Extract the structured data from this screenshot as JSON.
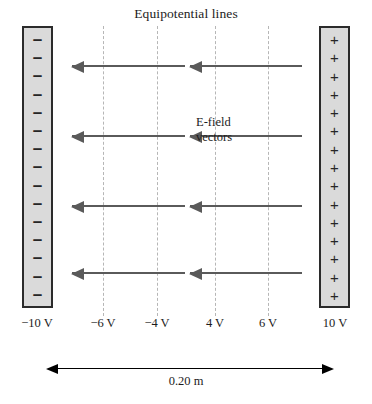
{
  "diagram": {
    "title": "Equipotential lines",
    "efield_label": {
      "line1": "E-field",
      "line2": "vectors"
    },
    "dimension": {
      "value": "0.20 m"
    },
    "plates": {
      "left": {
        "polarity_symbol": "–",
        "count": 15,
        "voltage_label": "−10 V"
      },
      "right": {
        "polarity_symbol": "+",
        "count": 15,
        "voltage_label": "10 V"
      }
    },
    "equipotentials": [
      {
        "label": "−6 V",
        "x": 103
      },
      {
        "label": "−4 V",
        "x": 157
      },
      {
        "label": "4 V",
        "x": 215
      },
      {
        "label": "6 V",
        "x": 268
      }
    ],
    "vectors": [
      {
        "y": 65,
        "x_start": 185,
        "x_end": 72
      },
      {
        "y": 65,
        "x_start": 302,
        "x_end": 190
      },
      {
        "y": 135,
        "x_start": 185,
        "x_end": 72
      },
      {
        "y": 135,
        "x_start": 302,
        "x_end": 190
      },
      {
        "y": 205,
        "x_start": 185,
        "x_end": 72
      },
      {
        "y": 205,
        "x_start": 302,
        "x_end": 190
      },
      {
        "y": 272,
        "x_start": 185,
        "x_end": 72
      },
      {
        "y": 272,
        "x_start": 302,
        "x_end": 190
      }
    ],
    "colors": {
      "plate_fill": "#dadada",
      "plate_border": "#2b2b2b",
      "equipotential": "#b6b6b6",
      "vector": "#5a5a5a",
      "dimension": "#000000",
      "background": "#ffffff"
    }
  }
}
